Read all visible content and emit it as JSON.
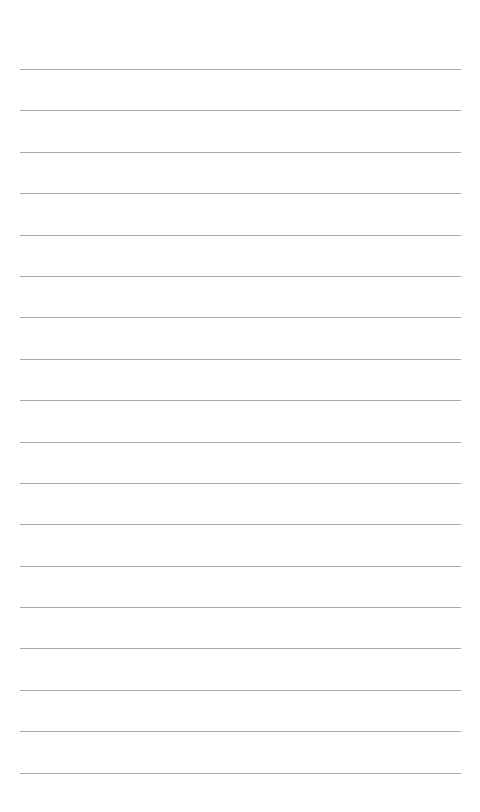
{
  "page": {
    "type": "lined-notepad",
    "background": "#ffffff",
    "rule_color": "#9a9a9a",
    "rules_y": [
      69,
      110,
      152,
      193,
      235,
      276,
      317,
      359,
      400,
      442,
      483,
      524,
      566,
      607,
      648,
      690,
      731,
      773
    ]
  }
}
